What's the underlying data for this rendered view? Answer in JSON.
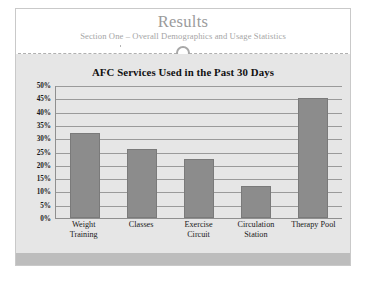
{
  "slide": {
    "title": "Results",
    "subtitle": "Section One – Overall Demographics and Usage Statistics",
    "accent_color": "#8c8c8c",
    "background_color": "#e6e6e6",
    "footer_color": "#bdbdbd"
  },
  "chart_data": {
    "type": "bar",
    "title": "AFC Services Used in the Past 30 Days",
    "xlabel": "",
    "ylabel": "",
    "ylim": [
      0,
      50
    ],
    "grid": true,
    "legend": "none",
    "categories": [
      "Weight Training",
      "Classes",
      "Exercise Circuit",
      "Circulation Station",
      "Therapy Pool"
    ],
    "category_lines": [
      [
        "Weight",
        "Training"
      ],
      [
        "Classes"
      ],
      [
        "Exercise",
        "Circuit"
      ],
      [
        "Circulation",
        "Station"
      ],
      [
        "Therapy Pool"
      ]
    ],
    "values": [
      32,
      26,
      22,
      12,
      45
    ],
    "value_labels": [
      "32%",
      "26%",
      "22%",
      "12%",
      "45%"
    ],
    "y_ticks": [
      50,
      45,
      40,
      35,
      30,
      25,
      20,
      15,
      10,
      5,
      0
    ],
    "y_tick_labels": [
      "50%",
      "45%",
      "40%",
      "35%",
      "30%",
      "25%",
      "20%",
      "15%",
      "10%",
      "5%",
      "0%"
    ],
    "bar_color": "#8c8c8c",
    "plot_background": "#e6e6e6"
  }
}
